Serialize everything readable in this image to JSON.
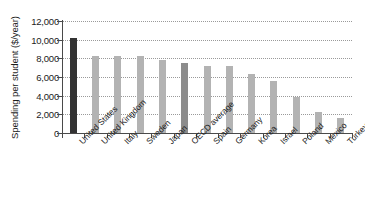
{
  "chart_data": {
    "type": "bar",
    "title": "",
    "xlabel": "",
    "ylabel": "Spending per student ($/year)",
    "ylim": [
      0,
      12000
    ],
    "ytick_labels": [
      "12,000",
      "10,000",
      "8,000",
      "6,000",
      "4,000",
      "2,000",
      "0"
    ],
    "yticks": [
      12000,
      10000,
      8000,
      6000,
      4000,
      2000,
      0
    ],
    "grid": "horizontal-dotted",
    "legend": "none",
    "categories": [
      "United States",
      "United Kingdom",
      "Italy",
      "Sweden",
      "Japan",
      "OECD average",
      "Spain",
      "Germany",
      "Korea",
      "Israel",
      "Poland",
      "Mexico",
      "Turkey"
    ],
    "values": [
      10200,
      8300,
      8250,
      8250,
      7800,
      7450,
      7200,
      7200,
      6300,
      5600,
      3900,
      2300,
      1600
    ],
    "bar_styles": [
      "highlight-primary",
      "normal",
      "normal",
      "normal",
      "normal",
      "highlight-secondary",
      "normal",
      "normal",
      "normal",
      "normal",
      "normal",
      "normal",
      "normal"
    ],
    "colors": {
      "bar_default": "#b3b3b3",
      "bar_highlight_primary": "#333333",
      "bar_highlight_secondary": "#8c8c8c",
      "gridline": "#9a9a9a",
      "axis": "#4a4a4a",
      "text": "#1c1c1c",
      "background": "#ffffff"
    }
  }
}
